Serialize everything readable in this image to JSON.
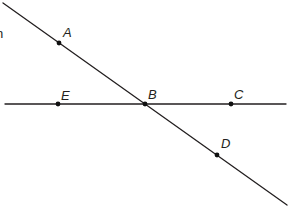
{
  "diagram": {
    "type": "geometry-lines",
    "colors": {
      "line": "#231f20",
      "point": "#111111",
      "background": "#ffffff"
    },
    "edge_text": "n",
    "lines": [
      {
        "name": "line-AD",
        "x1": 3,
        "y1": 3,
        "x2": 287,
        "y2": 205
      },
      {
        "name": "line-EC",
        "x1": 5,
        "y1": 104,
        "x2": 286,
        "y2": 104
      }
    ],
    "points": [
      {
        "label": "A",
        "x": 59,
        "y": 43,
        "lx": 63,
        "ly": 37
      },
      {
        "label": "E",
        "x": 58,
        "y": 104,
        "lx": 61,
        "ly": 100
      },
      {
        "label": "B",
        "x": 145,
        "y": 104,
        "lx": 148,
        "ly": 99
      },
      {
        "label": "C",
        "x": 231,
        "y": 104,
        "lx": 234,
        "ly": 99
      },
      {
        "label": "D",
        "x": 217,
        "y": 155,
        "lx": 221,
        "ly": 148
      }
    ]
  }
}
